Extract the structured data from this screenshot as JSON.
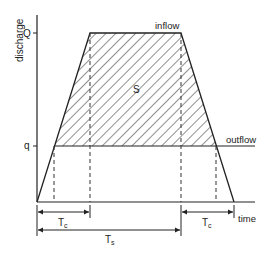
{
  "diagram": {
    "axes": {
      "y_label": "discharge",
      "x_label": "time",
      "y_ticks": [
        {
          "label": "Q",
          "description": "peak inflow discharge"
        },
        {
          "label": "q",
          "description": "constant outflow discharge"
        }
      ]
    },
    "curves": {
      "inflow_label": "inflow",
      "outflow_label": "outflow"
    },
    "region_label": "S",
    "dimensions": {
      "tc_left": "Tc",
      "tc_right": "Tc",
      "ts": "Ts"
    },
    "colors": {
      "line": "#222222",
      "hatch": "#333333",
      "background": "#ffffff"
    }
  }
}
